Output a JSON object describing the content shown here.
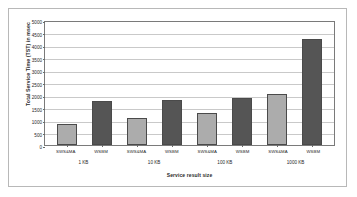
{
  "chart_data": {
    "type": "bar",
    "title": "",
    "xlabel": "Service result size",
    "ylabel": "Total Service Time (TST) in msec",
    "ylim": [
      0,
      5000
    ],
    "ytick_step": 500,
    "yticks": [
      "5000",
      "4500",
      "4000",
      "3500",
      "3000",
      "2500",
      "2000",
      "1500",
      "1000",
      "500",
      "0"
    ],
    "grid": true,
    "legend": "none",
    "categories": [
      "SWS&MA",
      "WSBM",
      "SWS&MA",
      "WSBM",
      "SWS&MA",
      "WSBM",
      "SWS&MA",
      "WSBM"
    ],
    "groups": [
      "1 KB",
      "10 KB",
      "100 KB",
      "1000 KB"
    ],
    "values": [
      850,
      1750,
      1070,
      1800,
      1300,
      1900,
      2050,
      4250
    ],
    "bars": [
      {
        "label": "SWS&MA",
        "group": "1 KB",
        "value": 850,
        "color": "#acacac"
      },
      {
        "label": "WSBM",
        "group": "1 KB",
        "value": 1750,
        "color": "#555555"
      },
      {
        "label": "SWS&MA",
        "group": "10 KB",
        "value": 1070,
        "color": "#acacac"
      },
      {
        "label": "WSBM",
        "group": "10 KB",
        "value": 1800,
        "color": "#555555"
      },
      {
        "label": "SWS&MA",
        "group": "100 KB",
        "value": 1300,
        "color": "#acacac"
      },
      {
        "label": "WSBM",
        "group": "100 KB",
        "value": 1900,
        "color": "#555555"
      },
      {
        "label": "SWS&MA",
        "group": "1000 KB",
        "value": 2050,
        "color": "#acacac"
      },
      {
        "label": "WSBM",
        "group": "1000 KB",
        "value": 4250,
        "color": "#555555"
      }
    ],
    "colors": {
      "series_light": "#acacac",
      "series_dark": "#555555",
      "gridline": "#c9c9c9",
      "axis": "#7a7a7a",
      "text": "#1f1f1f",
      "background": "#ffffff",
      "frame": "#b8b8b8"
    }
  }
}
